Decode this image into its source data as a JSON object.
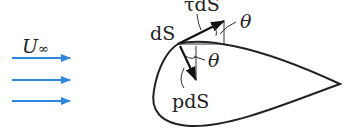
{
  "diagram": {
    "type": "airfoil surface force element",
    "colors": {
      "flow_arrows": "#2e86de",
      "lines": "#222222",
      "background": "#ffffff"
    },
    "labels": {
      "freestream": "U∞",
      "freestream_symbol": "U",
      "freestream_subscript": "∞",
      "surface_element": "dS",
      "shear_force": "τdS",
      "pressure_force": "pdS",
      "angle_top": "θ",
      "angle_bottom": "θ"
    },
    "flow_arrows": {
      "count": 3
    }
  }
}
